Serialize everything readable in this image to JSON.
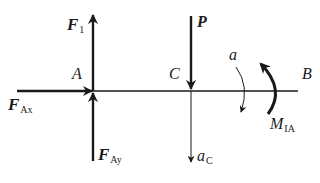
{
  "diagram": {
    "type": "free-body-diagram",
    "beam": {
      "start_label": "A",
      "end_label": "B",
      "mid_point_label": "C"
    },
    "labels": {
      "F1": {
        "main": "F",
        "sub": "1"
      },
      "FAx": {
        "main": "F",
        "sub": "Ax"
      },
      "FAy": {
        "main": "F",
        "sub": "Ay"
      },
      "P": {
        "main": "P"
      },
      "A": "A",
      "B": "B",
      "C": "C",
      "alpha": "a",
      "aC": {
        "main": "a",
        "sub": "C"
      },
      "MIA": {
        "main": "M",
        "sub": "IA"
      }
    },
    "forces": [
      {
        "name": "F1",
        "point": "A",
        "direction": "up"
      },
      {
        "name": "FAx",
        "point": "A",
        "direction": "right"
      },
      {
        "name": "FAy",
        "point": "A",
        "direction": "up"
      },
      {
        "name": "P",
        "point": "C",
        "direction": "down"
      }
    ],
    "kinematics": [
      {
        "name": "aC",
        "point": "C",
        "direction": "down"
      },
      {
        "name": "alpha",
        "direction": "clockwise"
      }
    ],
    "moments": [
      {
        "name": "MIA",
        "direction": "counterclockwise"
      }
    ],
    "colors": {
      "ink": "#1a1a1a",
      "background": "#ffffff"
    }
  }
}
